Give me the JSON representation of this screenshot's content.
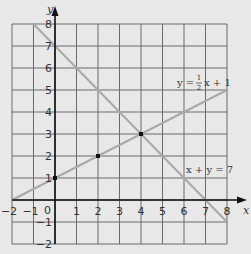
{
  "chart_data": {
    "type": "line",
    "title": "",
    "xlabel": "x",
    "ylabel": "y",
    "xlim": [
      -2,
      8
    ],
    "ylim": [
      -2,
      8
    ],
    "grid": true,
    "x_ticks": [
      "-2",
      "-1",
      "0",
      "1",
      "2",
      "3",
      "4",
      "5",
      "6",
      "7",
      "8"
    ],
    "y_ticks": [
      "-2",
      "-1",
      "1",
      "2",
      "3",
      "4",
      "5",
      "6",
      "7",
      "8"
    ],
    "origin_label": "0",
    "series": [
      {
        "name": "y = 1/2 x + 1",
        "label_parts": {
          "lhs": "y =",
          "num": "1",
          "den": "2",
          "rhs": "x + 1"
        },
        "x": [
          -2,
          8
        ],
        "y": [
          0,
          5
        ],
        "color": "#a8a8a8"
      },
      {
        "name": "x + y = 7",
        "label": "x + y = 7",
        "x": [
          -1,
          8
        ],
        "y": [
          8,
          -1
        ],
        "color": "#a8a8a8"
      }
    ],
    "points": [
      {
        "x": 0,
        "y": 1
      },
      {
        "x": 2,
        "y": 2
      },
      {
        "x": 4,
        "y": 3
      }
    ],
    "annotations": [
      "y = 1/2 x + 1",
      "x + y = 7"
    ]
  }
}
